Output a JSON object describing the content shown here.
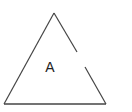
{
  "diagram": {
    "shape": "triangle",
    "label": "A",
    "stroke_color": "#444444",
    "vertices": {
      "apex": [
        54,
        13
      ],
      "bottom_left": [
        4,
        104
      ],
      "bottom_right": [
        106,
        104
      ]
    },
    "right_edge_gap": {
      "from": [
        77,
        52
      ],
      "to": [
        85,
        67
      ]
    }
  }
}
